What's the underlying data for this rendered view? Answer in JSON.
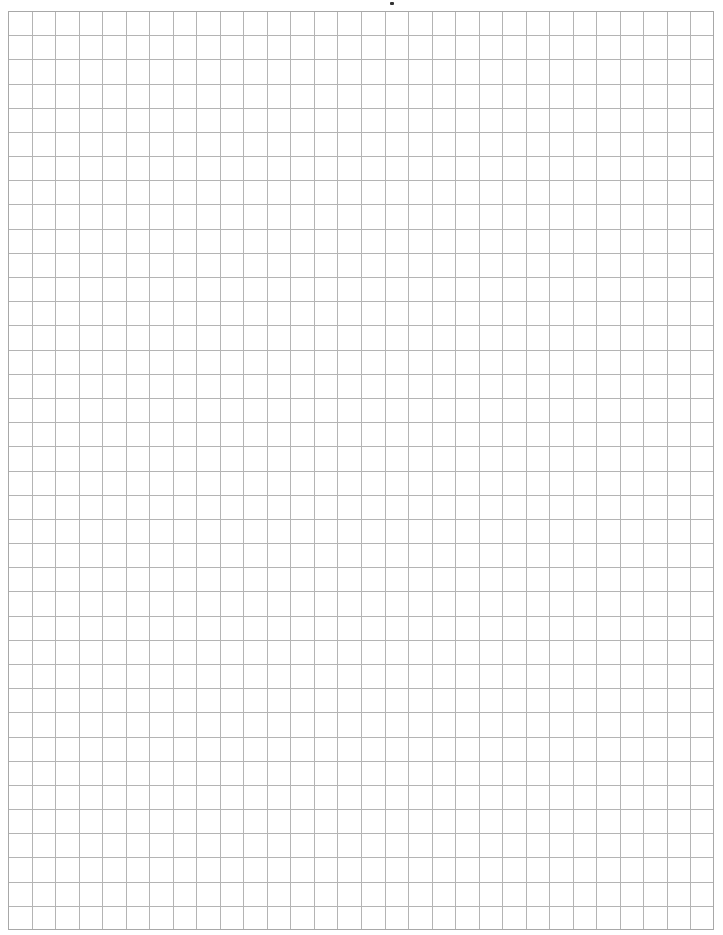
{
  "page": {
    "type": "graph-paper",
    "background_color": "#ffffff"
  },
  "grid": {
    "columns": 30,
    "rows": 38,
    "line_color": "#b4b4b4",
    "border_color": "#a8a8a8",
    "line_width": 1
  },
  "marks": [
    {
      "name": "top-speck",
      "color": "#333333"
    }
  ]
}
